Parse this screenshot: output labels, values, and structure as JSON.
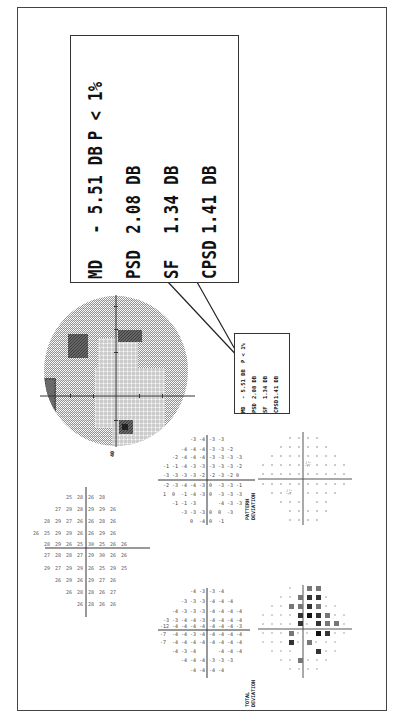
{
  "callout": {
    "rows": [
      {
        "label": "MD",
        "value": "- 5.51 DB",
        "extra": "P <  1%"
      },
      {
        "label": "PSD",
        "value": "2.08 DB",
        "extra": ""
      },
      {
        "label": "SF",
        "value": "1.34 DB",
        "extra": ""
      },
      {
        "label": "CPSD",
        "value": "1.41 DB",
        "extra": ""
      }
    ]
  },
  "small_box": {
    "rows": [
      {
        "label": "MD",
        "value": "- 5.51 DB",
        "extra": "P <  1%"
      },
      {
        "label": "PSD",
        "value": "2.08 DB",
        "extra": ""
      },
      {
        "label": "SF",
        "value": "1.34 DB",
        "extra": ""
      },
      {
        "label": "CPSD",
        "value": "1.41 DB",
        "extra": ""
      }
    ]
  },
  "plots": {
    "grayscale": {
      "title": "Grayscale map",
      "scale_label": "40"
    },
    "sensitivity": {
      "title": "Threshold values (dB)"
    },
    "total_deviation": {
      "title_line1": "TOTAL",
      "title_line2": "DEVIATION"
    },
    "pattern_deviation": {
      "title_line1": "PATTERN",
      "title_line2": "DEVIATION"
    },
    "total_prob": {
      "title": "Total deviation probability"
    },
    "pattern_prob": {
      "title": "Pattern deviation probability"
    }
  },
  "colors": {
    "ink": "#111111",
    "frame": "#444444",
    "gray_light": "#cfcfcf",
    "gray_mid": "#9a9a9a",
    "gray_dark": "#555555"
  }
}
